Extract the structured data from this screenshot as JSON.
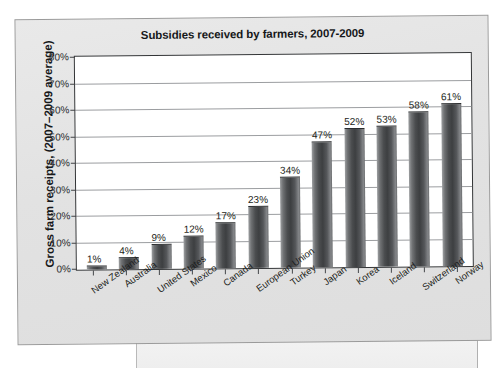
{
  "chart_data": {
    "type": "bar",
    "title": "Subsidies received by farmers, 2007-2009",
    "xlabel": "",
    "ylabel": "Gross farm receipts, (2007–2009 average)",
    "ylim": [
      0,
      80
    ],
    "grid": true,
    "legend": "none",
    "value_suffix": "%",
    "categories": [
      "New Zealand",
      "Australia",
      "United States",
      "Mexico",
      "Canada",
      "European Union",
      "Turkey",
      "Japan",
      "Korea",
      "Iceland",
      "Switzerland",
      "Norway"
    ],
    "values": [
      1,
      4,
      9,
      12,
      17,
      23,
      34,
      47,
      52,
      53,
      58,
      61
    ],
    "data_labels": [
      "1%",
      "4%",
      "9%",
      "12%",
      "17%",
      "23%",
      "34%",
      "47%",
      "52%",
      "53%",
      "58%",
      "61%"
    ],
    "ytick_labels": [
      "0%",
      "10%",
      "20%",
      "30%",
      "40%",
      "50%",
      "60%",
      "70%",
      "80%"
    ],
    "ytick_values": [
      0,
      10,
      20,
      30,
      40,
      50,
      60,
      70,
      80
    ],
    "colors": {
      "bar": "#4b4d4f",
      "plot_background": "#ffffff",
      "panel_background": "#e4e4e4",
      "gridline": "#9b9da0",
      "axis": "#333537",
      "text": "#16181a"
    }
  }
}
